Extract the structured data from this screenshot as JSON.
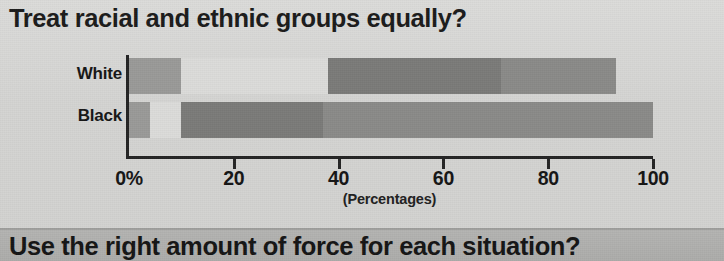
{
  "chart_data": {
    "type": "bar",
    "orientation": "horizontal",
    "stacked": true,
    "title": "Treat racial and ethnic groups equally?",
    "xlabel": "(Percentages)",
    "ylabel": "",
    "xlim": [
      0,
      100
    ],
    "grid": false,
    "legend": "none",
    "categories": [
      "White",
      "Black"
    ],
    "tick_labels": [
      "0%",
      "20",
      "40",
      "60",
      "80",
      "100"
    ],
    "tick_values": [
      0,
      20,
      40,
      60,
      80,
      100
    ],
    "series": [
      {
        "name": "Segment 1",
        "values": [
          10,
          4
        ],
        "color": "#9a9a98"
      },
      {
        "name": "Segment 2",
        "values": [
          28,
          6
        ],
        "color": "#dcdcda"
      },
      {
        "name": "Segment 3",
        "values": [
          33,
          27
        ],
        "color": "#7b7b79"
      },
      {
        "name": "Segment 4",
        "values": [
          22,
          63
        ],
        "color": "#8a8a88"
      }
    ],
    "bar_totals": [
      93,
      100
    ]
  },
  "title": {
    "text": "Treat racial and ethnic groups equally?"
  },
  "axis": {
    "caption": "(Percentages)",
    "ticks": [
      {
        "label": "0%",
        "value": 0
      },
      {
        "label": "20",
        "value": 20
      },
      {
        "label": "40",
        "value": 40
      },
      {
        "label": "60",
        "value": 60
      },
      {
        "label": "80",
        "value": 80
      },
      {
        "label": "100",
        "value": 100
      }
    ]
  },
  "categories": [
    {
      "label": "White"
    },
    {
      "label": "Black"
    }
  ],
  "bottom_banner": {
    "text": "Use the right amount of force for each situation?"
  },
  "colors": {
    "page_background": "#d4d4d2",
    "axis": "#232323",
    "text": "#151515",
    "banner_background": "#b0b0ae",
    "seg1": "#9a9a98",
    "seg2": "#dcdcda",
    "seg3": "#7b7b79",
    "seg4": "#8a8a88"
  }
}
